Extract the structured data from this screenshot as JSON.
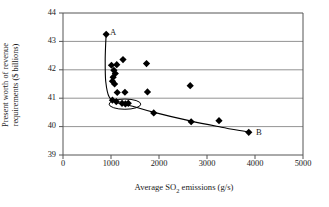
{
  "chart_data": {
    "type": "scatter",
    "title": "",
    "xlabel": "Average SO2 emissions (g/s)",
    "xlabel_parts": {
      "pre": "Average SO",
      "sub": "2",
      "post": " emissions (g/s)"
    },
    "ylabel": "Present worth of revenue requirements ($ billions)",
    "ylabel_line1": "Present worth of revenue",
    "ylabel_line2": "requirements ($ billions)",
    "xlim": [
      0,
      5000
    ],
    "ylim": [
      39,
      44
    ],
    "xticks": [
      0,
      1000,
      2000,
      3000,
      4000,
      5000
    ],
    "yticks": [
      39,
      40,
      41,
      42,
      43,
      44
    ],
    "xtick_labels": [
      "0",
      "1000",
      "2000",
      "3000",
      "4000",
      "5000"
    ],
    "ytick_labels": [
      "39",
      "40",
      "41",
      "42",
      "43",
      "44"
    ],
    "grid": "horizontal",
    "legend": "none",
    "marker": "filled-diamond",
    "marker_color": "#000000",
    "points": [
      {
        "x": 900,
        "y": 43.25
      },
      {
        "x": 1010,
        "y": 42.16
      },
      {
        "x": 1120,
        "y": 42.18
      },
      {
        "x": 1250,
        "y": 42.36
      },
      {
        "x": 1740,
        "y": 42.22
      },
      {
        "x": 1060,
        "y": 41.98
      },
      {
        "x": 1090,
        "y": 41.87
      },
      {
        "x": 1045,
        "y": 41.74
      },
      {
        "x": 1030,
        "y": 41.6
      },
      {
        "x": 1075,
        "y": 41.5
      },
      {
        "x": 2650,
        "y": 41.44
      },
      {
        "x": 1130,
        "y": 41.2
      },
      {
        "x": 1290,
        "y": 41.21
      },
      {
        "x": 1760,
        "y": 41.22
      },
      {
        "x": 1030,
        "y": 40.93
      },
      {
        "x": 1110,
        "y": 40.88
      },
      {
        "x": 1230,
        "y": 40.82
      },
      {
        "x": 1300,
        "y": 40.8
      },
      {
        "x": 1360,
        "y": 40.82
      },
      {
        "x": 1890,
        "y": 40.48
      },
      {
        "x": 2670,
        "y": 40.17
      },
      {
        "x": 3250,
        "y": 40.21
      },
      {
        "x": 3870,
        "y": 39.8
      }
    ],
    "frontier_curve": {
      "name": "pareto-frontier",
      "description": "curve from point A down through cluster to point B",
      "points": [
        {
          "x": 900,
          "y": 43.3
        },
        {
          "x": 880,
          "y": 42.4
        },
        {
          "x": 890,
          "y": 41.6
        },
        {
          "x": 960,
          "y": 41.05
        },
        {
          "x": 1120,
          "y": 40.85
        },
        {
          "x": 1450,
          "y": 40.72
        },
        {
          "x": 1900,
          "y": 40.5
        },
        {
          "x": 2650,
          "y": 40.2
        },
        {
          "x": 3300,
          "y": 39.98
        },
        {
          "x": 3880,
          "y": 39.8
        }
      ]
    },
    "highlight_ellipse": {
      "name": "cluster-highlight",
      "cx": 1290,
      "cy": 40.79,
      "rx": 330,
      "ry": 0.18
    },
    "annotations": [
      {
        "label": "A",
        "x": 980,
        "y": 43.28
      },
      {
        "label": "B",
        "x": 4020,
        "y": 39.78
      }
    ]
  }
}
